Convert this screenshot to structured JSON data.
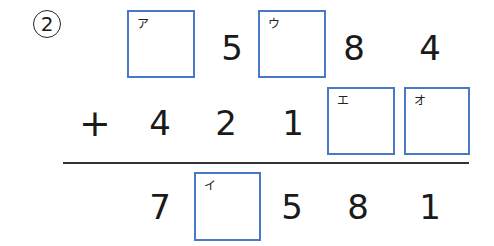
{
  "problem_number": "2",
  "row1": {
    "box_a": {
      "label": "ア"
    },
    "digit_hundreds": "5",
    "box_u": {
      "label": "ウ"
    },
    "digit_tens": "8",
    "digit_ones": "4"
  },
  "row2": {
    "operator": "+",
    "digit_tenthousands": "4",
    "digit_thousands": "2",
    "digit_hundreds": "1",
    "box_e": {
      "label": "エ"
    },
    "box_o": {
      "label": "オ"
    }
  },
  "row3": {
    "digit_tenthousands": "7",
    "box_i": {
      "label": "イ"
    },
    "digit_hundreds": "5",
    "digit_tens": "8",
    "digit_ones": "1"
  },
  "colors": {
    "box_border": "#4a78c8",
    "text": "#1a1a1a"
  }
}
